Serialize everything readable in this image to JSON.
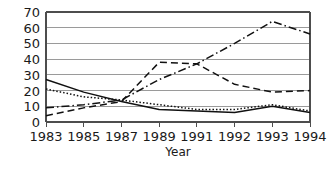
{
  "chart_data": {
    "type": "line",
    "title": "",
    "xlabel": "Year",
    "ylabel": "",
    "categories": [
      "1983",
      "1985",
      "1987",
      "1989",
      "1991",
      "1992",
      "1993",
      "1994"
    ],
    "x_tick_labels": [
      "1983",
      "1985",
      "1987",
      "1989",
      "1991",
      "1992",
      "1993",
      "1994"
    ],
    "y_tick_labels": [
      "0",
      "10",
      "20",
      "30",
      "40",
      "50",
      "60",
      "70"
    ],
    "y_ticks": [
      0,
      10,
      20,
      30,
      40,
      50,
      60,
      70
    ],
    "ylim": [
      0,
      70
    ],
    "grid": "horizontal",
    "legend": "none",
    "series": [
      {
        "name": "series-solid",
        "style": "solid",
        "dasharray": "none",
        "color": "#111111",
        "values": [
          27,
          19,
          13,
          8,
          7,
          6,
          10,
          6
        ]
      },
      {
        "name": "series-dotted",
        "style": "dotted",
        "dasharray": "1.5,2",
        "color": "#111111",
        "values": [
          21,
          16,
          14,
          11,
          8,
          8,
          11,
          7
        ]
      },
      {
        "name": "series-dashed",
        "style": "dashed",
        "dasharray": "7,4",
        "color": "#111111",
        "values": [
          4,
          9,
          13,
          38,
          37,
          24,
          19,
          20
        ]
      },
      {
        "name": "series-dash-dot",
        "style": "dash-dot",
        "dasharray": "8,3,1.5,3",
        "color": "#111111",
        "values": [
          9,
          11,
          14,
          27,
          37,
          50,
          64,
          56
        ]
      }
    ]
  },
  "axes": {
    "x_axis_title": "Year"
  },
  "colors": {
    "background": "#ffffff",
    "grid": "#9a9a9a",
    "axis": "#4d4d4d",
    "line": "#111111",
    "text": "#1a1a1a"
  }
}
